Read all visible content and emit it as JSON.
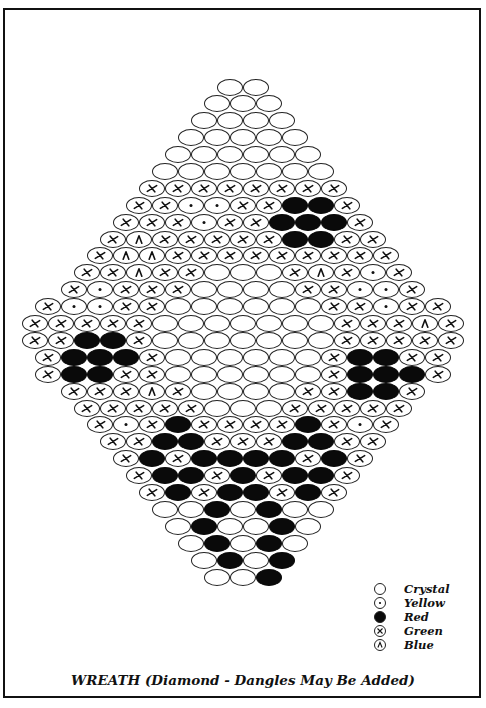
{
  "title": "WREATH (Diamond - Dangles May Be Added)",
  "legend": [
    {
      "code": "C",
      "label": "Crystal",
      "icon": "open-circle-icon"
    },
    {
      "code": "Y",
      "label": "Yellow",
      "icon": "dotted-circle-icon"
    },
    {
      "code": "R",
      "label": "Red",
      "icon": "filled-circle-icon"
    },
    {
      "code": "G",
      "label": "Green",
      "icon": "crossed-circle-icon"
    },
    {
      "code": "B",
      "label": "Blue",
      "icon": "caret-circle-icon"
    }
  ],
  "colors": {
    "ink": "#111111",
    "paper": "#ffffff",
    "red_fill": "#0a0a0a"
  },
  "pattern": {
    "center_x": 243,
    "top_y": 87,
    "row_pitch": 14.4,
    "bead_pitch": 26,
    "rows": [
      "CC",
      "CCC",
      "CCCC",
      "CCCCC",
      "CCCCCC",
      "CCCCCCC",
      "GGGGGGGG",
      "GGYYGGRRG",
      "GGGYGGRRRG",
      "GBGGGGGRRGG",
      "GBBGGGGGGGGG",
      "GGBGGCCCGBGYG",
      "GYGGGCCCCGGYYG",
      "GYYGGCCCCCCGGYGG",
      "GGGGGCCCCCCCGGGBG",
      "GGRRGCCCCCCCGGGGG",
      "GRRRGCCCCCCGRRGG",
      "GRRGGCCCCCCGRRRG",
      "GGGBGCCCCGGRRG",
      "GGGGGCCCGGGGG",
      "GYGRGGGGRGYG",
      "GGRRGGGRRGG",
      "GRGRRRRGRG",
      "GRRGRGRRG",
      "GRGRRGRG",
      "CCRCRCC",
      "CRCCRC",
      "CRCRC",
      "CRCR",
      "CCR"
    ]
  }
}
